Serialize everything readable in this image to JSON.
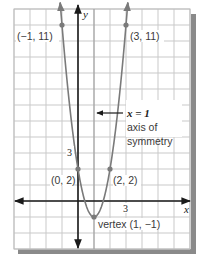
{
  "chart_data": {
    "type": "line",
    "title": "",
    "equation": "y = 3(x - 1)^2 - 1",
    "xlabel": "x",
    "ylabel": "y",
    "xlim": [
      -4,
      7
    ],
    "ylim": [
      -3,
      12
    ],
    "grid": true,
    "grid_step": 1,
    "ticks": {
      "x": [
        {
          "value": 3,
          "label": "3"
        }
      ],
      "y": [
        {
          "value": 3,
          "label": "3"
        }
      ]
    },
    "series": [
      {
        "name": "parabola",
        "x": [
          -1,
          0,
          1,
          2,
          3
        ],
        "y": [
          11,
          2,
          -1,
          2,
          11
        ]
      }
    ],
    "points": [
      {
        "x": -1,
        "y": 11,
        "label": "(−1, 11)"
      },
      {
        "x": 3,
        "y": 11,
        "label": "(3, 11)"
      },
      {
        "x": 0,
        "y": 2,
        "label": "(0, 2)"
      },
      {
        "x": 2,
        "y": 2,
        "label": "(2, 2)"
      },
      {
        "x": 1,
        "y": -1,
        "label": "vertex (1, −1)"
      }
    ],
    "annotations": [
      {
        "text": "x = 1",
        "note": "axis of symmetry",
        "x": 1
      }
    ],
    "legend": null
  },
  "labels": {
    "x_axis": "x",
    "y_axis": "y",
    "x_tick_3": "3",
    "y_tick_3": "3",
    "point_neg1_11": "(−1, 11)",
    "point_3_11": "(3, 11)",
    "point_0_2": "(0, 2)",
    "point_2_2": "(2, 2)",
    "vertex": "vertex (1, −1)",
    "axis_eq": "x = 1",
    "axis_note_line1": "axis of",
    "axis_note_line2": "symmetry"
  },
  "colors": {
    "grid": "#c9c9c9",
    "axis": "#1a1a1a",
    "curve": "#7a7a7a",
    "shadow": "#8a8a8a"
  }
}
